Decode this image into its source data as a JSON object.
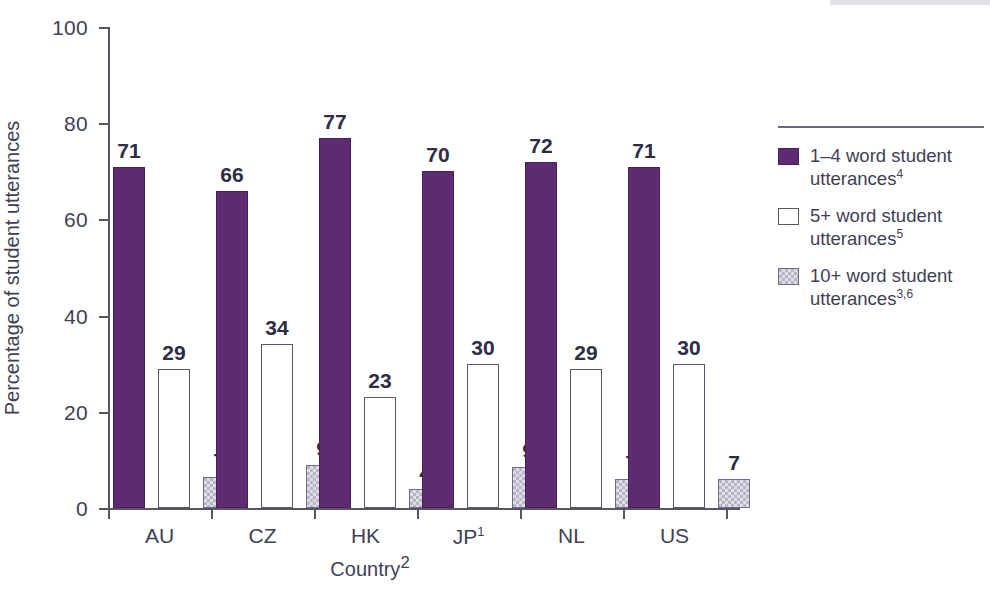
{
  "chart_data": {
    "type": "bar",
    "title": "",
    "xlabel": "Country",
    "xlabel_sup": "2",
    "ylabel": "Percentage of student utterances",
    "ylim": [
      0,
      100
    ],
    "ytick_step": 20,
    "yticks": [
      100,
      80,
      60,
      40,
      20,
      0
    ],
    "grid": false,
    "legend_position": "right",
    "categories": [
      "AU",
      "CZ",
      "HK",
      "JP",
      "NL",
      "US"
    ],
    "category_sups": [
      "",
      "",
      "",
      "1",
      "",
      ""
    ],
    "series": [
      {
        "name": "1–4 word student utterances",
        "name_sup": "4",
        "color": "#5e2b72",
        "values": [
          71,
          66,
          77,
          70,
          72,
          71
        ]
      },
      {
        "name": "5+ word student utterances",
        "name_sup": "5",
        "color": "#ffffff",
        "values": [
          29,
          34,
          23,
          30,
          29,
          30
        ]
      },
      {
        "name": "10+ word student utterances",
        "name_sup": "3,6",
        "color": "#b9b4c6",
        "values": [
          7,
          9,
          4,
          9,
          7,
          7
        ]
      }
    ],
    "bar_actual_heights": {
      "note": "drawn bar tops differ slightly from printed labels",
      "series0": [
        71,
        66,
        77,
        70,
        72,
        71
      ],
      "series1": [
        29,
        34,
        23,
        30,
        29,
        30
      ],
      "series2": [
        6.5,
        9,
        4,
        8.5,
        6,
        6
      ]
    }
  },
  "axes": {
    "y_title": "Percentage of student utterances",
    "x_title": "Country",
    "x_title_sup": "2",
    "tick_100": "100",
    "tick_80": "80",
    "tick_60": "60",
    "tick_40": "40",
    "tick_20": "20",
    "tick_0": "0"
  },
  "legend": {
    "items": [
      {
        "label": "1–4 word student",
        "label2": "utterances",
        "sup": "4"
      },
      {
        "label": "5+ word student",
        "label2": "utterances",
        "sup": "5"
      },
      {
        "label": "10+ word student",
        "label2": "utterances",
        "sup": "3,6"
      }
    ]
  },
  "colors": {
    "series0": "#5e2b72",
    "series1": "#ffffff",
    "series2": "#b9b4c6",
    "axis": "#555566",
    "text": "#3f3f55",
    "label": "#2d2d45"
  }
}
